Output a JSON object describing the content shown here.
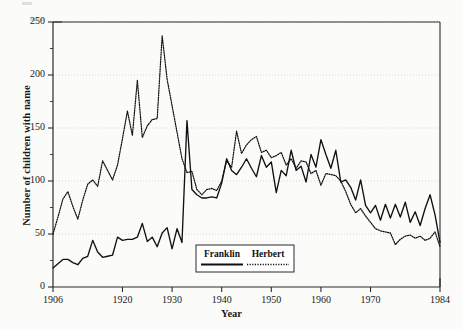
{
  "chart_data": {
    "type": "line",
    "title": "",
    "xlabel": "Year",
    "ylabel": "Number of children with name",
    "xlim": [
      1906,
      1984
    ],
    "ylim": [
      0,
      250
    ],
    "xticks": [
      1906,
      1920,
      1930,
      1940,
      1950,
      1960,
      1970,
      1984
    ],
    "yticks": [
      0,
      50,
      100,
      150,
      200,
      250
    ],
    "grid": "horizontal-dotted",
    "legend_position": "bottom-center-inside",
    "legend": [
      {
        "name": "Franklin",
        "style": "solid"
      },
      {
        "name": "Herbert",
        "style": "dotted"
      }
    ],
    "x": [
      1906,
      1907,
      1908,
      1909,
      1910,
      1911,
      1912,
      1913,
      1914,
      1915,
      1916,
      1917,
      1918,
      1919,
      1920,
      1921,
      1922,
      1923,
      1924,
      1925,
      1926,
      1927,
      1928,
      1929,
      1930,
      1931,
      1932,
      1933,
      1934,
      1935,
      1936,
      1937,
      1938,
      1939,
      1940,
      1941,
      1942,
      1943,
      1944,
      1945,
      1946,
      1947,
      1948,
      1949,
      1950,
      1951,
      1952,
      1953,
      1954,
      1955,
      1956,
      1957,
      1958,
      1959,
      1960,
      1961,
      1962,
      1963,
      1964,
      1965,
      1966,
      1967,
      1968,
      1969,
      1970,
      1971,
      1972,
      1973,
      1974,
      1975,
      1976,
      1977,
      1978,
      1979,
      1980,
      1981,
      1982,
      1983,
      1984
    ],
    "series": [
      {
        "name": "Franklin",
        "style": "solid",
        "values": [
          18,
          22,
          26,
          26,
          23,
          21,
          27,
          29,
          44,
          33,
          28,
          29,
          30,
          47,
          44,
          45,
          45,
          47,
          60,
          43,
          47,
          38,
          51,
          56,
          36,
          55,
          42,
          157,
          92,
          87,
          84,
          84,
          85,
          84,
          98,
          121,
          110,
          106,
          113,
          121,
          112,
          104,
          124,
          113,
          118,
          89,
          110,
          105,
          129,
          110,
          114,
          99,
          125,
          113,
          139,
          125,
          112,
          129,
          99,
          101,
          94,
          82,
          101,
          77,
          70,
          77,
          63,
          78,
          65,
          78,
          66,
          80,
          61,
          71,
          58,
          74,
          87,
          68,
          42
        ]
      },
      {
        "name": "Herbert",
        "style": "dotted",
        "values": [
          50,
          66,
          83,
          90,
          76,
          64,
          82,
          97,
          101,
          95,
          119,
          110,
          101,
          115,
          140,
          166,
          143,
          195,
          141,
          152,
          158,
          159,
          237,
          196,
          171,
          146,
          121,
          108,
          109,
          92,
          87,
          92,
          93,
          91,
          100,
          119,
          113,
          147,
          126,
          134,
          139,
          142,
          127,
          129,
          122,
          124,
          127,
          115,
          121,
          112,
          119,
          118,
          107,
          110,
          96,
          107,
          106,
          105,
          100,
          90,
          78,
          70,
          74,
          67,
          61,
          55,
          53,
          52,
          51,
          40,
          45,
          48,
          49,
          46,
          48,
          44,
          46,
          52,
          38
        ]
      }
    ]
  },
  "axes": {
    "xticks": [
      "1906",
      "1920",
      "1930",
      "1940",
      "1950",
      "1960",
      "1970",
      "1984"
    ],
    "yticks": [
      "250",
      "200",
      "150",
      "100",
      "50",
      "0"
    ],
    "xlabel": "Year",
    "ylabel": "Number of children with name"
  },
  "legend": {
    "franklin_label": "Franklin",
    "herbert_label": "Herbert"
  },
  "colors": {
    "line": "#111111",
    "grid": "#cfcfcf",
    "frame": "#2b2b2b",
    "background": "#fbfbfa"
  }
}
